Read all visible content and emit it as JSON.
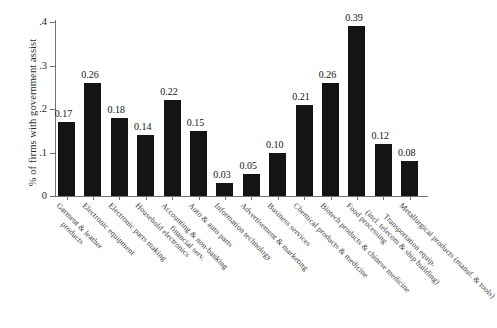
{
  "chart_data": {
    "type": "bar",
    "title": "",
    "xlabel": "",
    "ylabel": "% of firms with government assist",
    "ylim": [
      0,
      0.43
    ],
    "grid": false,
    "legend": "none",
    "ytick_labels": [
      "0",
      ".1",
      ".2",
      ".3",
      ".4"
    ],
    "ytick_values": [
      0,
      0.1,
      0.2,
      0.3,
      0.4
    ],
    "categories": [
      "Garment & leather products",
      "Electronic equipment",
      "Electronic parts making",
      "Household electronics",
      "Accounting & non-banking financial serv.",
      "Auto & auto parts",
      "Information technology",
      "Advertisement & marketing",
      "Business services",
      "Chemical products & medicine",
      "Biotech products & chinese medicine",
      "Food processing",
      "Transportation equip. (incl. telecom & ship building)",
      "Metallurgical products (manuf. & tools)"
    ],
    "category_lines": [
      [
        "Garment & leather",
        "products"
      ],
      [
        "Electronic equipment"
      ],
      [
        "Electronic parts making"
      ],
      [
        "Household electronics"
      ],
      [
        "Accounting & non-banking",
        "financial serv."
      ],
      [
        "Auto & auto parts"
      ],
      [
        "Information technology"
      ],
      [
        "Advertisement & marketing"
      ],
      [
        "Business services"
      ],
      [
        "Chemical products & medicine"
      ],
      [
        "Biotech products & chinese medicine"
      ],
      [
        "Food processing"
      ],
      [
        "Transportation equip.",
        "(incl. telecom & ship building)"
      ],
      [
        "Metallurgical products (manuf. & tools)"
      ]
    ],
    "values": [
      0.17,
      0.26,
      0.18,
      0.14,
      0.22,
      0.15,
      0.03,
      0.05,
      0.1,
      0.21,
      0.26,
      0.39,
      0.12,
      0.08
    ],
    "value_labels": [
      "0.17",
      "0.26",
      "0.18",
      "0.14",
      "0.22",
      "0.15",
      "0.03",
      "0.05",
      "0.10",
      "0.21",
      "0.26",
      "0.39",
      "0.12",
      "0.08"
    ],
    "bar_color": "#141414",
    "axis_color": "#707070",
    "text_color": "#1f1f1f"
  }
}
